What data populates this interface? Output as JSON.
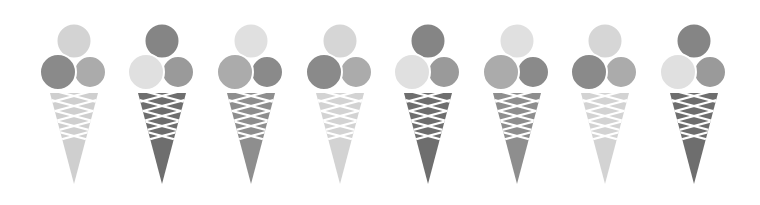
{
  "image": {
    "width": 760,
    "height": 205,
    "background": "#ffffff",
    "description": "Row of eight grayscale ice cream cones, each with three scoops"
  },
  "palette": {
    "light": "#d6d6d6",
    "lighter": "#e2e2e2",
    "mid": "#a6a6a6",
    "dark": "#858585",
    "darker": "#6f6f6f",
    "lattice": "#ffffff"
  },
  "cones": [
    {
      "cx": 74,
      "top": "#d3d3d3",
      "left": "#8a8a8a",
      "right": "#ababab",
      "cone": "#cfcfcf"
    },
    {
      "cx": 162,
      "top": "#858585",
      "left": "#e0e0e0",
      "right": "#9a9a9a",
      "cone": "#6e6e6e"
    },
    {
      "cx": 251,
      "top": "#e0e0e0",
      "left": "#ababab",
      "right": "#8a8a8a",
      "cone": "#8e8e8e"
    },
    {
      "cx": 340,
      "top": "#d6d6d6",
      "left": "#8a8a8a",
      "right": "#ababab",
      "cone": "#d3d3d3"
    },
    {
      "cx": 428,
      "top": "#858585",
      "left": "#e0e0e0",
      "right": "#9a9a9a",
      "cone": "#6e6e6e"
    },
    {
      "cx": 517,
      "top": "#e0e0e0",
      "left": "#ababab",
      "right": "#8a8a8a",
      "cone": "#8e8e8e"
    },
    {
      "cx": 605,
      "top": "#d6d6d6",
      "left": "#8a8a8a",
      "right": "#ababab",
      "cone": "#d3d3d3"
    },
    {
      "cx": 694,
      "top": "#858585",
      "left": "#e0e0e0",
      "right": "#9a9a9a",
      "cone": "#6e6e6e"
    }
  ]
}
